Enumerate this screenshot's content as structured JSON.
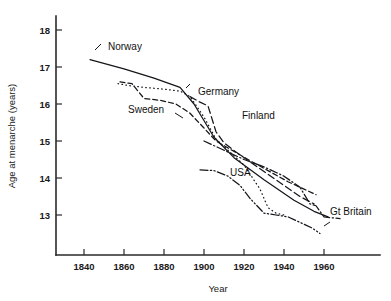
{
  "chart_data": {
    "type": "line",
    "title": "",
    "xlabel": "Year",
    "ylabel": "Age at menarche (years)",
    "xlim": [
      1825,
      1975
    ],
    "ylim": [
      12.4,
      18.2
    ],
    "xticks": [
      1840,
      1860,
      1880,
      1900,
      1920,
      1940,
      1960
    ],
    "xtick_labels": [
      "1840",
      "1860",
      "1880",
      "1900",
      "1920",
      "1940",
      "1960"
    ],
    "yticks": [
      13,
      14,
      15,
      16,
      17,
      18
    ],
    "ytick_labels": [
      "13",
      "14",
      "15",
      "16",
      "17",
      "18"
    ],
    "grid": false,
    "legend": "inline-labels",
    "series": [
      {
        "name": "Norway",
        "style": "solid",
        "label_x": 1852,
        "label_y": 17.45,
        "x": [
          1843,
          1860,
          1875,
          1888,
          1895,
          1905,
          1915,
          1930,
          1945,
          1955,
          1962
        ],
        "y": [
          17.2,
          16.95,
          16.7,
          16.45,
          16.0,
          15.1,
          14.55,
          13.95,
          13.4,
          13.1,
          12.95
        ]
      },
      {
        "name": "Germany",
        "style": "dotted",
        "label_x": 1897,
        "label_y": 16.25,
        "x": [
          1857,
          1862,
          1870,
          1880,
          1888,
          1893,
          1900,
          1906,
          1912,
          1920,
          1928,
          1932,
          1936,
          1940
        ],
        "y": [
          16.55,
          16.5,
          16.45,
          16.4,
          16.35,
          16.2,
          15.65,
          15.05,
          14.75,
          14.35,
          13.7,
          13.2,
          13.05,
          13.0
        ]
      },
      {
        "name": "Sweden",
        "style": "dashed",
        "label_x": 1862,
        "label_y": 15.75,
        "x": [
          1858,
          1864,
          1870,
          1878,
          1886,
          1893,
          1900,
          1906,
          1914,
          1922,
          1932,
          1942,
          1950,
          1956
        ],
        "y": [
          16.6,
          16.55,
          16.15,
          16.1,
          16.0,
          15.75,
          15.35,
          15.0,
          14.75,
          14.5,
          14.2,
          13.9,
          13.7,
          13.55
        ]
      },
      {
        "name": "Finland",
        "style": "dashed-long",
        "label_x": 1919,
        "label_y": 15.6,
        "x": [
          1893,
          1898,
          1902,
          1906,
          1910,
          1916,
          1924,
          1932,
          1940,
          1948,
          1955
        ],
        "y": [
          16.2,
          16.05,
          15.95,
          15.25,
          14.95,
          14.7,
          14.4,
          14.1,
          13.8,
          13.5,
          13.3
        ]
      },
      {
        "name": "USA",
        "style": "dash-dot-dot",
        "label_x": 1913,
        "label_y": 14.05,
        "x": [
          1898,
          1905,
          1912,
          1918,
          1923,
          1930,
          1936,
          1942,
          1948,
          1954,
          1958
        ],
        "y": [
          14.22,
          14.2,
          14.05,
          13.8,
          13.45,
          13.05,
          13.0,
          12.95,
          12.8,
          12.65,
          12.5
        ]
      },
      {
        "name": "Gt Britain",
        "style": "dash-dot",
        "label_x": 1963,
        "label_y": 13.0,
        "x": [
          1900,
          1910,
          1920,
          1930,
          1940,
          1948,
          1953,
          1956,
          1960,
          1968
        ],
        "y": [
          15.0,
          14.75,
          14.5,
          14.3,
          14.05,
          13.75,
          13.3,
          13.25,
          12.95,
          12.9
        ]
      }
    ]
  },
  "axes": {
    "x_title": "Year",
    "y_title": "Age at menarche (years)"
  }
}
